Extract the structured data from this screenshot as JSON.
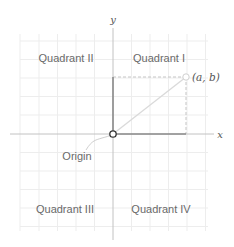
{
  "diagram": {
    "axes": {
      "x_label": "x",
      "y_label": "y"
    },
    "quadrants": [
      {
        "id": "I",
        "label": "Quadrant I"
      },
      {
        "id": "II",
        "label": "Quadrant II"
      },
      {
        "id": "III",
        "label": "Quadrant III"
      },
      {
        "id": "IV",
        "label": "Quadrant IV"
      }
    ],
    "origin": {
      "label": "Origin"
    },
    "point": {
      "label": "(a, b)"
    },
    "colors": {
      "grid": "#ececec",
      "axis": "#bdbdbd",
      "segment": "#8a8a8a",
      "dashed": "#c4c4c4",
      "diagonal": "#d8d8d8",
      "text": "#6a6a6a"
    }
  }
}
